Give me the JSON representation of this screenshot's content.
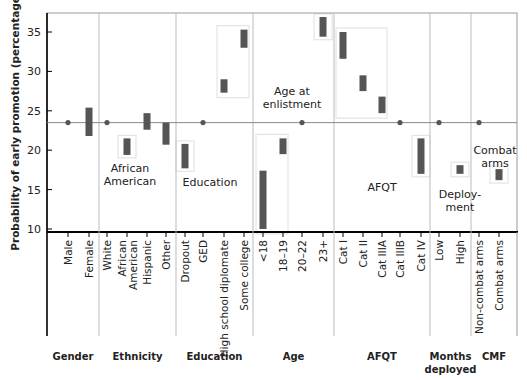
{
  "chart_data": {
    "type": "range-bar (dot-and-bar effect plot)",
    "title": "",
    "ylabel": "Probability of early promotion (percentage)",
    "xlabel": "",
    "ylim": [
      10,
      37
    ],
    "yticks": [
      10,
      15,
      20,
      25,
      30,
      35
    ],
    "grid": false,
    "reference_line": 23.5,
    "groups": [
      {
        "name": "Gender",
        "label_lines": [
          "Gender"
        ],
        "annotation": [],
        "categories": [
          {
            "label": "Male",
            "type": "reference",
            "value": 23.5
          },
          {
            "label": "Female",
            "type": "range",
            "low": 21.8,
            "high": 25.4
          }
        ]
      },
      {
        "name": "Ethnicity",
        "label_lines": [
          "Ethnicity"
        ],
        "annotation": [
          "African",
          "American"
        ],
        "categories": [
          {
            "label": "White",
            "type": "reference",
            "value": 23.5
          },
          {
            "label": "African American",
            "label_lines": [
              "African",
              "American"
            ],
            "type": "range",
            "low": 19.4,
            "high": 21.5,
            "boxed": true
          },
          {
            "label": "Hispanic",
            "type": "range",
            "low": 22.6,
            "high": 24.7
          },
          {
            "label": "Other",
            "type": "range",
            "low": 20.7,
            "high": 23.5
          }
        ]
      },
      {
        "name": "Education",
        "label_lines": [
          "Education"
        ],
        "annotation": [
          "Education"
        ],
        "categories": [
          {
            "label": "Dropout",
            "type": "range",
            "low": 17.7,
            "high": 20.8,
            "boxed": true
          },
          {
            "label": "GED",
            "type": "reference",
            "value": 23.5
          },
          {
            "label": "High school diplomate",
            "type": "range",
            "low": 27.3,
            "high": 29.0
          },
          {
            "label": "Some college",
            "type": "range",
            "low": 33.0,
            "high": 35.3
          }
        ]
      },
      {
        "name": "Age",
        "label_lines": [
          "Age"
        ],
        "annotation": [
          "Age at",
          "enlistment"
        ],
        "categories": [
          {
            "label": "<18",
            "type": "range",
            "low": 10.0,
            "high": 17.4
          },
          {
            "label": "18–19",
            "type": "range",
            "low": 19.5,
            "high": 21.5
          },
          {
            "label": "20–22",
            "type": "reference",
            "value": 23.5
          },
          {
            "label": "23+",
            "type": "range",
            "low": 34.4,
            "high": 36.9,
            "boxed": true
          }
        ]
      },
      {
        "name": "AFQT",
        "label_lines": [
          "AFQT"
        ],
        "annotation": [
          "AFQT"
        ],
        "categories": [
          {
            "label": "Cat I",
            "type": "range",
            "low": 31.6,
            "high": 35.0
          },
          {
            "label": "Cat II",
            "type": "range",
            "low": 27.5,
            "high": 29.5
          },
          {
            "label": "Cat IIIA",
            "type": "range",
            "low": 24.7,
            "high": 26.8
          },
          {
            "label": "Cat IIIB",
            "type": "reference",
            "value": 23.5
          },
          {
            "label": "Cat IV",
            "type": "range",
            "low": 17.0,
            "high": 21.5,
            "boxed": true
          }
        ]
      },
      {
        "name": "Months deployed",
        "label_lines": [
          "Months",
          "deployed"
        ],
        "annotation": [
          "Deploy-",
          "ment"
        ],
        "categories": [
          {
            "label": "Low",
            "type": "reference",
            "value": 23.5
          },
          {
            "label": "High",
            "type": "range",
            "low": 17.0,
            "high": 18.1,
            "boxed": true
          }
        ]
      },
      {
        "name": "CMF",
        "label_lines": [
          "CMF"
        ],
        "annotation": [
          "Combat",
          "arms"
        ],
        "categories": [
          {
            "label": "Non-combat arms",
            "type": "reference",
            "value": 23.5
          },
          {
            "label": "Combat arms",
            "type": "range",
            "low": 16.2,
            "high": 17.6,
            "boxed": true
          }
        ]
      }
    ],
    "highlight_boxes": [
      {
        "group": "Education",
        "covers": [
          "High school diplomate",
          "Some college"
        ]
      },
      {
        "group": "Age",
        "covers": [
          "<18",
          "18–19"
        ]
      },
      {
        "group": "AFQT",
        "covers": [
          "Cat I",
          "Cat II",
          "Cat IIIA"
        ]
      }
    ],
    "colors": {
      "bar": "#555555",
      "dot": "#555555",
      "reference_line": "#888888",
      "axis": "#000000",
      "divider": "#bbbbbb",
      "box": "#e4e4e4"
    }
  }
}
